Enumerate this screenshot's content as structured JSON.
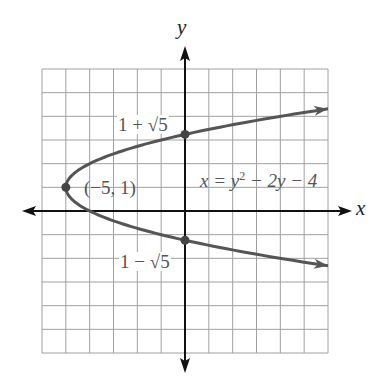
{
  "chart_data": {
    "type": "line",
    "title": "",
    "xlabel": "x",
    "ylabel": "y",
    "xlim": [
      -6,
      6
    ],
    "ylim": [
      -6,
      6
    ],
    "grid": true,
    "series": [
      {
        "name": "x = y² − 2y − 4",
        "equation": "x = y^2 - 2y - 4",
        "kind": "parabola opening right",
        "color": "#555555",
        "points": [
          {
            "x": 6,
            "y": 4.317
          },
          {
            "x": 0,
            "y": 3.236
          },
          {
            "x": -4,
            "y": 2
          },
          {
            "x": -5,
            "y": 1
          },
          {
            "x": -4,
            "y": 0
          },
          {
            "x": 0,
            "y": -1.236
          },
          {
            "x": 6,
            "y": -2.317
          }
        ]
      }
    ],
    "marked_points": [
      {
        "x": -5,
        "y": 1,
        "label": "(−5, 1)"
      },
      {
        "x": 0,
        "y": 3.236,
        "label": "1 + √5"
      },
      {
        "x": 0,
        "y": -1.236,
        "label": "1 − √5"
      }
    ],
    "annotations": [
      "x = y² − 2y − 4",
      "(−5, 1)",
      "1 + √5",
      "1 − √5"
    ]
  },
  "labels": {
    "x_axis": "x",
    "y_axis": "y",
    "vertex": "(−5, 1)",
    "upper_intercept": "1 + √5",
    "lower_intercept": "1 − √5",
    "equation_prefix": "x = y",
    "equation_exp": "2",
    "equation_suffix": " − 2y − 4"
  },
  "colors": {
    "grid": "#a0a0a0",
    "axis": "#111111",
    "curve": "#555555"
  }
}
